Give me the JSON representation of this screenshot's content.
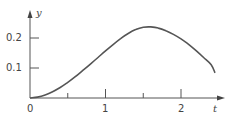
{
  "chart_data": {
    "type": "line",
    "title": "",
    "xlabel": "t",
    "ylabel": "y",
    "xlim": [
      0,
      2.6
    ],
    "ylim": [
      0,
      0.27
    ],
    "grid": false,
    "legend": null,
    "x_ticks": [
      0,
      0.5,
      1,
      1.5,
      2
    ],
    "x_tick_labels": [
      "0",
      "",
      "1",
      "",
      "2"
    ],
    "y_ticks": [
      0.1,
      0.2
    ],
    "y_tick_labels": [
      "0.1",
      "0.2"
    ],
    "series": [
      {
        "name": "y(t)",
        "x": [
          0,
          0.1,
          0.2,
          0.3,
          0.4,
          0.5,
          0.6,
          0.7,
          0.8,
          0.9,
          1.0,
          1.1,
          1.2,
          1.3,
          1.4,
          1.5,
          1.6,
          1.7,
          1.8,
          1.9,
          2.0,
          2.1,
          2.2,
          2.3,
          2.4,
          2.45
        ],
        "values": [
          0,
          0.003,
          0.01,
          0.021,
          0.035,
          0.052,
          0.071,
          0.092,
          0.113,
          0.135,
          0.157,
          0.178,
          0.198,
          0.215,
          0.228,
          0.236,
          0.237,
          0.233,
          0.224,
          0.212,
          0.197,
          0.179,
          0.158,
          0.135,
          0.111,
          0.084
        ],
        "color": "#555555"
      }
    ]
  },
  "labels": {
    "y_axis": "y",
    "x_axis": "t",
    "origin": "0",
    "x_tick_1": "1",
    "x_tick_2": "2",
    "y_tick_01": "0.1",
    "y_tick_02": "0.2"
  }
}
